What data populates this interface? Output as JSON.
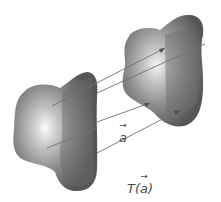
{
  "diagram": {
    "type": "geometric-translation",
    "shapes": [
      {
        "id": "original-blob",
        "role": "original figure"
      },
      {
        "id": "translated-blob",
        "role": "image under translation"
      }
    ],
    "arrows_count": 4,
    "labels": {
      "vector": "a",
      "transform_prefix": "T(",
      "transform_arg": "a",
      "transform_suffix": ")"
    },
    "colors": {
      "blob_dark": "#5a5a5a",
      "blob_light": "#f4f4f4",
      "line": "#6a6a6a",
      "text": "#4a4a4a",
      "background": "#ffffff"
    }
  }
}
